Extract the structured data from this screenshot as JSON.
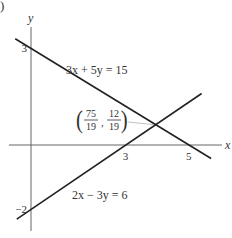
{
  "figure_label": ")",
  "chart_data": {
    "type": "line",
    "title": "",
    "xlabel": "x",
    "ylabel": "y",
    "xlim": [
      -0.7,
      6.0
    ],
    "ylim": [
      -2.7,
      3.6
    ],
    "grid": false,
    "x_ticks": [
      {
        "value": 3,
        "label": "3"
      },
      {
        "value": 5,
        "label": "5"
      }
    ],
    "y_ticks": [
      {
        "value": 3,
        "label": "3"
      },
      {
        "value": -2,
        "label": "−2"
      }
    ],
    "series": [
      {
        "name": "3x + 5y = 15",
        "equation": {
          "a": 3,
          "b": 5,
          "c": 15
        },
        "x_range": [
          -0.5,
          5.7
        ],
        "label": "3x + 5y = 15"
      },
      {
        "name": "2x − 3y = 6",
        "equation": {
          "a": 2,
          "b": -3,
          "c": 6
        },
        "x_range": [
          -0.45,
          5.4
        ],
        "label": "2x − 3y = 6"
      }
    ],
    "annotations": [
      {
        "type": "point-label",
        "x": 3.947,
        "y": 0.632,
        "text_x_num": "75",
        "text_x_den": "19",
        "text_y_num": "12",
        "text_y_den": "19"
      }
    ]
  }
}
